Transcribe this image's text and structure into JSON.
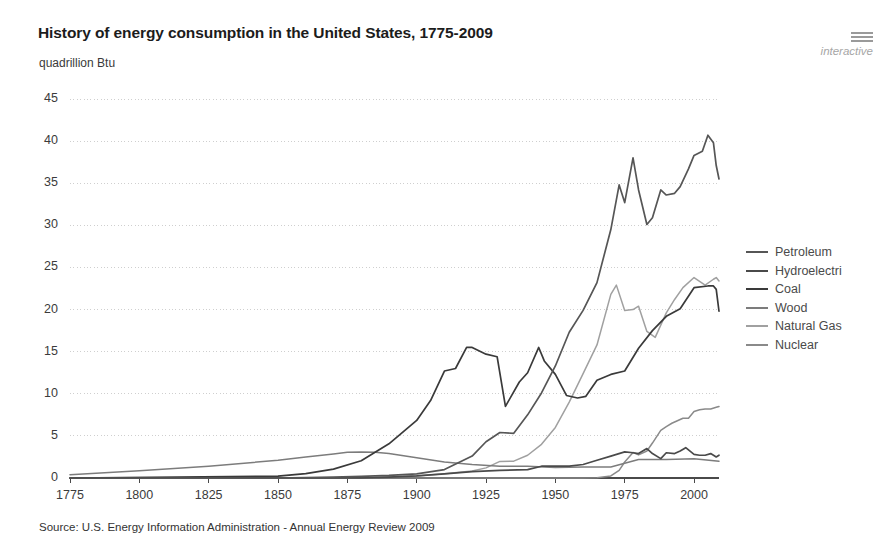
{
  "header": {
    "title": "History of energy consumption in the United States, 1775-2009",
    "unit_label": "quadrillion Btu",
    "logo": {
      "wordmark": "interactive",
      "bars_icon": "hamburger-bars-icon"
    }
  },
  "footer": {
    "source": "Source: U.S. Energy Information Administration - Annual Energy Review 2009"
  },
  "colors": {
    "petroleum": "#565656",
    "hydroelectric": "#4a4a4a",
    "coal": "#3a3a3a",
    "wood": "#7c7c7c",
    "natural_gas": "#a0a0a0",
    "nuclear": "#8a8a8a",
    "grid": "#cfcfcf",
    "axis": "#4a4a4a",
    "text": "#3b3b3b",
    "logo": "#a6a6a6"
  },
  "chart_data": {
    "type": "line",
    "title": "History of energy consumption in the United States, 1775-2009",
    "xlabel": "",
    "ylabel": "quadrillion Btu",
    "xlim": [
      1775,
      2009
    ],
    "ylim": [
      0,
      45
    ],
    "xticks": [
      1775,
      1800,
      1825,
      1850,
      1875,
      1900,
      1925,
      1950,
      1975,
      2000
    ],
    "yticks": [
      0,
      5,
      10,
      15,
      20,
      25,
      30,
      35,
      40,
      45
    ],
    "grid": "horizontal-dotted",
    "legend_position": "right",
    "series": [
      {
        "name": "Petroleum",
        "color": "#565656",
        "x": [
          1775,
          1850,
          1860,
          1870,
          1880,
          1890,
          1900,
          1910,
          1920,
          1925,
          1930,
          1935,
          1940,
          1945,
          1950,
          1955,
          1960,
          1965,
          1970,
          1973,
          1975,
          1978,
          1980,
          1983,
          1985,
          1988,
          1990,
          1993,
          1995,
          1998,
          2000,
          2003,
          2005,
          2007,
          2008,
          2009
        ],
        "values": [
          0,
          0,
          0.05,
          0.1,
          0.2,
          0.3,
          0.5,
          1.0,
          2.6,
          4.3,
          5.4,
          5.3,
          7.5,
          10.1,
          13.3,
          17.3,
          19.9,
          23.2,
          29.5,
          34.8,
          32.7,
          38.0,
          34.2,
          30.1,
          30.9,
          34.2,
          33.6,
          33.8,
          34.6,
          36.7,
          38.3,
          38.8,
          40.7,
          39.8,
          37.1,
          35.5
        ]
      },
      {
        "name": "Hydroelectric",
        "color": "#4a4a4a",
        "x": [
          1775,
          1880,
          1890,
          1900,
          1910,
          1920,
          1930,
          1940,
          1945,
          1950,
          1955,
          1960,
          1965,
          1970,
          1975,
          1978,
          1980,
          1983,
          1985,
          1988,
          1990,
          1993,
          1995,
          1997,
          2000,
          2002,
          2004,
          2006,
          2008,
          2009
        ],
        "values": [
          0,
          0.02,
          0.1,
          0.25,
          0.5,
          0.75,
          0.9,
          1.0,
          1.4,
          1.4,
          1.4,
          1.6,
          2.1,
          2.6,
          3.1,
          3.0,
          2.9,
          3.5,
          2.9,
          2.3,
          3.0,
          2.9,
          3.2,
          3.6,
          2.8,
          2.7,
          2.7,
          2.9,
          2.5,
          2.7
        ]
      },
      {
        "name": "Coal",
        "color": "#3a3a3a",
        "x": [
          1775,
          1850,
          1860,
          1870,
          1880,
          1890,
          1900,
          1905,
          1910,
          1914,
          1918,
          1920,
          1925,
          1929,
          1932,
          1937,
          1940,
          1944,
          1946,
          1950,
          1954,
          1958,
          1961,
          1965,
          1970,
          1975,
          1980,
          1985,
          1990,
          1995,
          2000,
          2005,
          2007,
          2008,
          2009
        ],
        "values": [
          0,
          0.22,
          0.52,
          1.05,
          2.05,
          4.06,
          6.84,
          9.2,
          12.7,
          13.0,
          15.5,
          15.5,
          14.7,
          14.4,
          8.5,
          11.4,
          12.5,
          15.5,
          13.9,
          12.3,
          9.8,
          9.5,
          9.7,
          11.6,
          12.3,
          12.7,
          15.4,
          17.5,
          19.2,
          20.1,
          22.6,
          22.8,
          22.8,
          22.4,
          19.8
        ]
      },
      {
        "name": "Wood",
        "color": "#7c7c7c",
        "x": [
          1775,
          1800,
          1825,
          1850,
          1860,
          1870,
          1875,
          1880,
          1885,
          1890,
          1900,
          1910,
          1920,
          1930,
          1940,
          1950,
          1960,
          1970,
          1980,
          1990,
          2000,
          2009
        ],
        "values": [
          0.4,
          0.85,
          1.4,
          2.1,
          2.5,
          2.85,
          3.05,
          3.1,
          3.05,
          2.9,
          2.4,
          1.9,
          1.6,
          1.4,
          1.4,
          1.25,
          1.3,
          1.3,
          2.2,
          2.2,
          2.3,
          2.0
        ]
      },
      {
        "name": "Natural Gas",
        "color": "#a0a0a0",
        "x": [
          1775,
          1885,
          1890,
          1900,
          1910,
          1920,
          1925,
          1930,
          1935,
          1940,
          1945,
          1950,
          1955,
          1960,
          1965,
          1970,
          1972,
          1975,
          1978,
          1980,
          1983,
          1986,
          1990,
          1993,
          1996,
          2000,
          2004,
          2007,
          2008,
          2009
        ],
        "values": [
          0,
          0.05,
          0.15,
          0.25,
          0.5,
          0.82,
          1.2,
          1.97,
          2.0,
          2.7,
          4.0,
          6.0,
          9.0,
          12.4,
          15.8,
          21.8,
          22.9,
          19.9,
          20.0,
          20.4,
          17.4,
          16.7,
          19.6,
          21.2,
          22.6,
          23.8,
          22.9,
          23.6,
          23.8,
          23.4
        ]
      },
      {
        "name": "Nuclear",
        "color": "#8a8a8a",
        "x": [
          1775,
          1957,
          1960,
          1965,
          1970,
          1973,
          1975,
          1978,
          1980,
          1983,
          1985,
          1988,
          1990,
          1992,
          1994,
          1996,
          1998,
          2000,
          2002,
          2004,
          2006,
          2008,
          2009
        ],
        "values": [
          0,
          0.0,
          0.01,
          0.04,
          0.24,
          0.91,
          1.9,
          3.02,
          2.74,
          3.2,
          4.15,
          5.66,
          6.1,
          6.5,
          6.8,
          7.1,
          7.1,
          7.9,
          8.1,
          8.2,
          8.2,
          8.4,
          8.5
        ]
      }
    ]
  },
  "legend": {
    "items": [
      {
        "label": "Petroleum",
        "series": "Petroleum"
      },
      {
        "label": "Hydroelectri",
        "series": "Hydroelectric"
      },
      {
        "label": "Coal",
        "series": "Coal"
      },
      {
        "label": "Wood",
        "series": "Wood"
      },
      {
        "label": "Natural Gas",
        "series": "Natural Gas"
      },
      {
        "label": "Nuclear",
        "series": "Nuclear"
      }
    ]
  }
}
